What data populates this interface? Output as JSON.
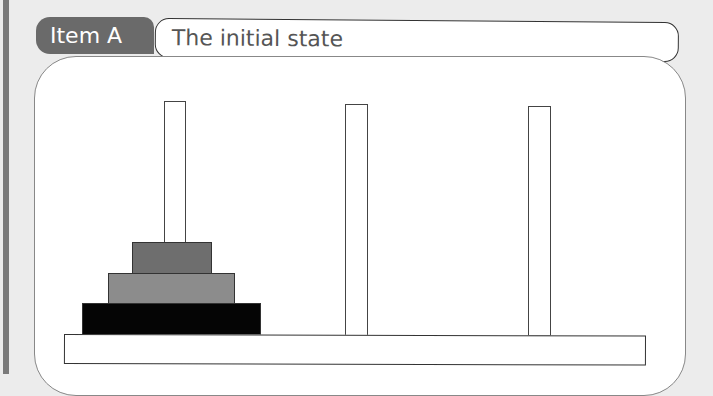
{
  "header": {
    "item_label": "Item A",
    "title": "The initial state"
  },
  "diagram": {
    "name": "Tower of Hanoi",
    "pegs": [
      "left",
      "middle",
      "right"
    ],
    "disks": [
      {
        "peg": "left",
        "size": "small",
        "color": "#6e6e6e"
      },
      {
        "peg": "left",
        "size": "medium",
        "color": "#8c8c8c"
      },
      {
        "peg": "left",
        "size": "large",
        "color": "#050505"
      }
    ]
  }
}
